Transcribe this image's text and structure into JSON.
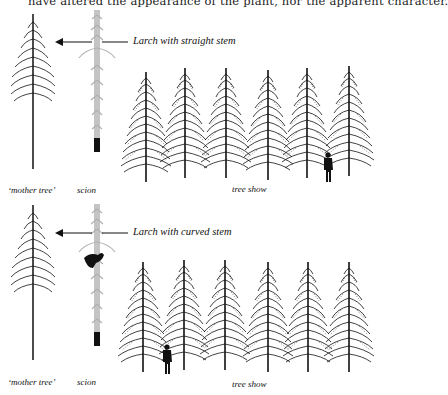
{
  "page": {
    "top_text": "have altered the appearance of the plant, nor the apparent character."
  },
  "panels": [
    {
      "caption": "Larch with straight stem",
      "labels": {
        "mother_tree": "‘mother tree’",
        "scion": "scion",
        "tree_show": "tree show"
      },
      "scion_has_bird": false,
      "person_position": "right"
    },
    {
      "caption": "Larch with curved stem",
      "labels": {
        "mother_tree": "‘mother tree’",
        "scion": "scion",
        "tree_show": "tree show"
      },
      "scion_has_bird": true,
      "person_position": "left"
    }
  ],
  "colors": {
    "ink": "#111111",
    "scion_grey": "#b8b8b8"
  }
}
